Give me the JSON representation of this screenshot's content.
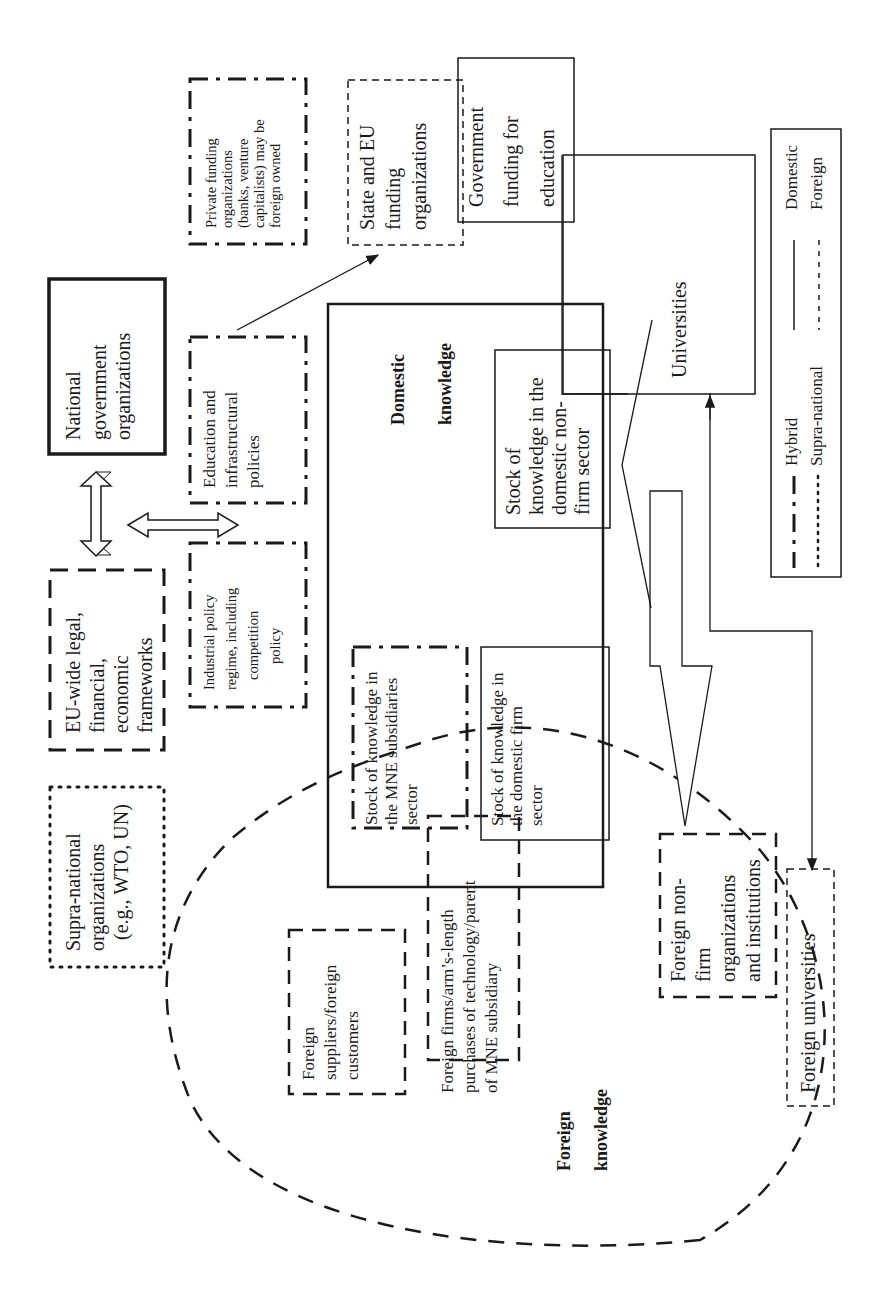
{
  "diagram": {
    "orientation": "rotated 90deg counter-clockwise",
    "boxes": {
      "national_gov": {
        "lines": [
          "National",
          "government",
          "organizations"
        ],
        "border": "solid-thick"
      },
      "eu_frameworks": {
        "lines": [
          "EU-wide legal,",
          "financial,",
          "economic",
          "frameworks"
        ],
        "border": "dashed-thick"
      },
      "supra_national": {
        "lines": [
          "Supra-national",
          "organizations",
          "(e.g., WTO, UN)"
        ],
        "border": "dotted"
      },
      "private_funding": {
        "lines": [
          "Private funding",
          "organizations",
          "(banks, venture",
          "capitalists) may be",
          "foreign owned"
        ],
        "border": "dash-dot"
      },
      "state_eu_funding": {
        "lines": [
          "State and EU",
          "funding",
          "organizations"
        ],
        "border": "dashed-thin"
      },
      "gov_funding_education": {
        "lines": [
          "Government",
          "funding for",
          "education"
        ],
        "border": "solid-thin"
      },
      "education_policies": {
        "lines": [
          "Education and",
          "infrastructural",
          "policies"
        ],
        "border": "dash-dot"
      },
      "industrial_policy": {
        "lines": [
          "Industrial policy",
          "regime, including",
          "competition",
          "policy"
        ],
        "border": "dash-dot"
      },
      "domestic_knowledge": {
        "lines": [
          "Domestic",
          "knowledge"
        ],
        "border": "solid-thick"
      },
      "stock_nonfirm": {
        "lines": [
          "Stock of",
          "knowledge in the",
          "domestic non-",
          "firm sector"
        ],
        "border": "solid-thin"
      },
      "stock_mne": {
        "lines": [
          "Stock of knowledge in",
          "the MNE subsidiaries",
          "sector"
        ],
        "border": "dash-dot"
      },
      "stock_domestic_firm": {
        "lines": [
          "Stock of knowledge in",
          "the domestic firm",
          "sector"
        ],
        "border": "solid-thin"
      },
      "universities": {
        "lines": [
          "Universities"
        ],
        "border": "solid-thin"
      },
      "foreign_suppliers": {
        "lines": [
          "Foreign",
          "suppliers/foreign",
          "customers"
        ],
        "border": "dashed"
      },
      "foreign_firms": {
        "lines": [
          "Foreign firms/arm’s-length",
          "purchases of technology/parent",
          "of MNE subsidiary"
        ],
        "border": "dashed"
      },
      "foreign_nonfirm": {
        "lines": [
          "Foreign non-",
          "firm",
          "organizations",
          "and institutions"
        ],
        "border": "dashed"
      },
      "foreign_universities": {
        "lines": [
          "Foreign universities"
        ],
        "border": "dashed-thin"
      },
      "foreign_knowledge": {
        "lines": [
          "Foreign",
          "knowledge"
        ],
        "border": "dashed-ellipse"
      }
    },
    "legend": {
      "items": [
        {
          "label": "Hybrid",
          "style": "dash-dot"
        },
        {
          "label": "Supra-national",
          "style": "dotted"
        },
        {
          "label": "Domestic",
          "style": "solid"
        },
        {
          "label": "Foreign",
          "style": "dashed"
        }
      ]
    }
  }
}
